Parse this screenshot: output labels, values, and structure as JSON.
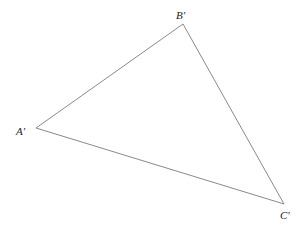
{
  "diagram": {
    "type": "triangle",
    "vertices": [
      {
        "id": "A",
        "label": "A′",
        "x": 36,
        "y": 128,
        "label_x": 16,
        "label_y": 135
      },
      {
        "id": "B",
        "label": "B′",
        "x": 183,
        "y": 24,
        "label_x": 176,
        "label_y": 19
      },
      {
        "id": "C",
        "label": "C′",
        "x": 284,
        "y": 204,
        "label_x": 280,
        "label_y": 219
      }
    ],
    "edges": [
      [
        "A",
        "B"
      ],
      [
        "B",
        "C"
      ],
      [
        "C",
        "A"
      ]
    ],
    "edge_color": "#8a8a8a"
  }
}
